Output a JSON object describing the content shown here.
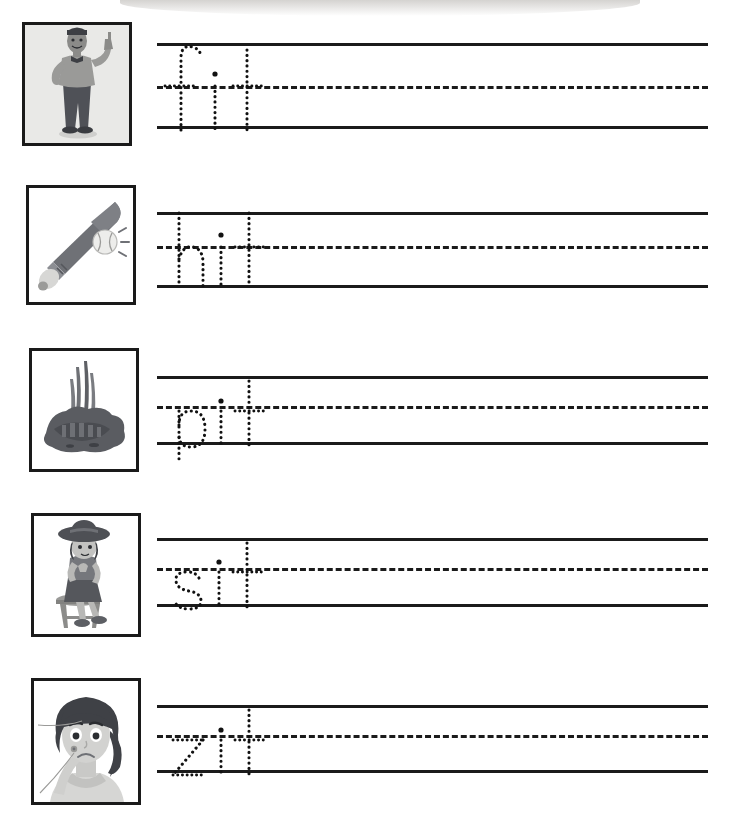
{
  "worksheet": {
    "title": "Short i Word Family Handwriting Tracing Worksheet",
    "page_width": 733,
    "page_height": 826,
    "background_color": "#ffffff",
    "line_color": "#1b1b1b",
    "trace_color": "#111111",
    "card_border_color": "#1a1a1a"
  },
  "rows": [
    {
      "index": 1,
      "word": "fit",
      "letters": [
        "f",
        "i",
        "t"
      ],
      "picture_name": "man-standing-pointing-fit",
      "picture_alt": "Cartoon fit man standing with hand on hip pointing upward",
      "card": {
        "x": 22,
        "y": 22,
        "width": 110,
        "height": 124
      },
      "rules": {
        "x": 157,
        "width": 551,
        "top_y": 43,
        "mid_y": 86,
        "bottom_y": 126
      }
    },
    {
      "index": 2,
      "word": "hit",
      "letters": [
        "h",
        "i",
        "t"
      ],
      "picture_name": "baseball-bat-hitting-ball",
      "picture_alt": "Baseball bat striking a baseball",
      "card": {
        "x": 26,
        "y": 185,
        "width": 110,
        "height": 120
      },
      "rules": {
        "x": 157,
        "width": 551,
        "top_y": 212,
        "mid_y": 246,
        "bottom_y": 285
      }
    },
    {
      "index": 3,
      "word": "pit",
      "letters": [
        "p",
        "i",
        "t"
      ],
      "picture_name": "dirt-pit-with-plants",
      "picture_alt": "Dark pit of soil with grass sprouting",
      "card": {
        "x": 29,
        "y": 348,
        "width": 110,
        "height": 124
      },
      "rules": {
        "x": 157,
        "width": 551,
        "top_y": 376,
        "mid_y": 406,
        "bottom_y": 442
      }
    },
    {
      "index": 4,
      "word": "sit",
      "letters": [
        "s",
        "i",
        "t"
      ],
      "picture_name": "girl-sitting-on-stool",
      "picture_alt": "Girl in a wide hat sitting on a wooden stool",
      "card": {
        "x": 31,
        "y": 513,
        "width": 110,
        "height": 124
      },
      "rules": {
        "x": 157,
        "width": 551,
        "top_y": 538,
        "mid_y": 568,
        "bottom_y": 604
      }
    },
    {
      "index": 5,
      "word": "zit",
      "letters": [
        "z",
        "i",
        "t"
      ],
      "picture_name": "girl-with-zit-on-face",
      "picture_alt": "Worried girl touching a pimple on her cheek",
      "card": {
        "x": 31,
        "y": 678,
        "width": 110,
        "height": 127
      },
      "rules": {
        "x": 157,
        "width": 551,
        "top_y": 705,
        "mid_y": 735,
        "bottom_y": 770
      }
    }
  ]
}
